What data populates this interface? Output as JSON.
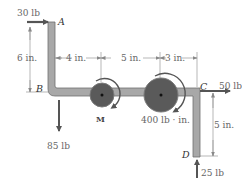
{
  "diagram": {
    "type": "bent bar with pulleys (statics)",
    "colors": {
      "bar_fill": "#a8a8a8",
      "bar_edge": "#6e6e6e",
      "pulley_fill": "#5a5a5a",
      "pulley_edge": "#7a7a7a",
      "arrow": "#555555",
      "dimension": "#888888",
      "text": "#666666"
    },
    "points": {
      "A": "A",
      "B": "B",
      "C": "C",
      "D": "D"
    },
    "forces": {
      "top_left": "30 lb",
      "bottom_left": "85 lb",
      "right": "50 lb",
      "bottom_right": "25 lb"
    },
    "couples": {
      "unknown": "M",
      "known": "400 lb · in."
    },
    "dimensions": {
      "ab_height": "6 in.",
      "b_to_pulley1": "4 in.",
      "pulley1_to_pulley2": "5 in.",
      "pulley2_to_c": "3 in.",
      "cd_height": "5 in."
    }
  }
}
